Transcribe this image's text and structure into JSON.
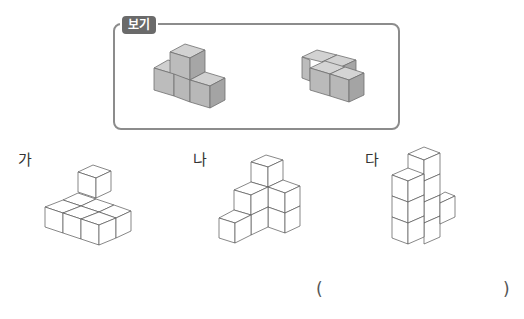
{
  "example_box": {
    "tag": "보기",
    "figures": [
      {
        "name": "example-shape-1",
        "cubes": 4,
        "description": "three cubes in a row with one stacked on the middle-left"
      },
      {
        "name": "example-shape-2",
        "cubes": 4,
        "description": "2x2 flat square arrangement offset"
      }
    ],
    "colors": {
      "cube_fill_front": "#b8b8b8",
      "cube_fill_top": "#d0d0d0",
      "cube_fill_side": "#a4a4a4",
      "border": "#8c8c8c",
      "tag_bg": "#6a6a6a"
    }
  },
  "options": [
    {
      "label": "가"
    },
    {
      "label": "나"
    },
    {
      "label": "다"
    }
  ],
  "answer": {
    "open_paren": "(",
    "close_paren": ")",
    "value": ""
  }
}
